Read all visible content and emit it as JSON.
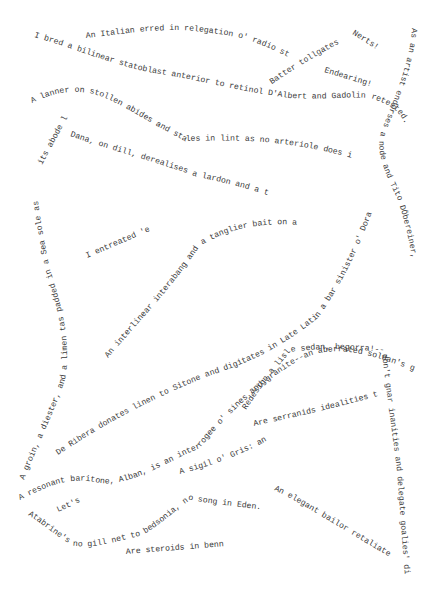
{
  "page": {
    "background": "#ffffff",
    "text_color": "#3a3a3a"
  },
  "phrases": [
    {
      "id": "italian",
      "text": "An Italian erred in relegation o' radio stars."
    },
    {
      "id": "bilinear",
      "text": "I bred a bilinear statoblast anterior to retinol D'Albert and Gadolin retested."
    },
    {
      "id": "batter",
      "text": "Batter tollgates!"
    },
    {
      "id": "nerts",
      "text": "Nerts!"
    },
    {
      "id": "endearing",
      "text": "Endearing!"
    },
    {
      "id": "artist",
      "text": "As an artist endorses a node and Tito DÖbereiner, Neri is batting."
    },
    {
      "id": "lanner",
      "text": "A lanner on stollen abides and stales in lint as no arteriole does in Deere."
    },
    {
      "id": "abode",
      "text": "its abode leant."
    },
    {
      "id": "dana",
      "text": "Dana, on dill, derealises a lardon and a triode."
    },
    {
      "id": "groin",
      "text": "A groin, a diester, and a limen tas padded in a Sea sole as"
    },
    {
      "id": "entreated",
      "text": "I entreated 'er."
    },
    {
      "id": "interlinear",
      "text": "An interlinear interabang and a tanglier bait on a bed boggled Lorrain."
    },
    {
      "id": "ribera",
      "text": "De Ribera donates linen to Sitone and digitates in Late Latin a bar sinister o' Dorati's."
    },
    {
      "id": "baritone",
      "text": "A resonant baritone, Alban, is an interrogee o' sines and granite--an aberrated soldan's gerbera in little."
    },
    {
      "id": "redesign",
      "text": "Redesign a lisle sedan, begorra!--don't gnar inanities and delegate goalies' dietaries."
    },
    {
      "id": "serranids",
      "text": "Are serranids idealities to Geseli?"
    },
    {
      "id": "sigil",
      "text": "A sigil o' Gris: an airline's eld."
    },
    {
      "id": "lets",
      "text": "Let's!"
    },
    {
      "id": "atabrine",
      "text": "Atabrine's no gill net to bedsonia, no song in Eden."
    },
    {
      "id": "steroids",
      "text": "Are steroids in benne?"
    },
    {
      "id": "bailor",
      "text": "An elegant bailor retaliated."
    }
  ]
}
